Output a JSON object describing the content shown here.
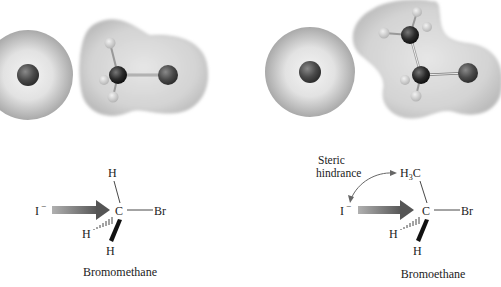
{
  "panels": [
    {
      "name": "bromomethane",
      "nucleophile": "I",
      "nucleophile_charge": "−",
      "center": "C",
      "leaving_group": "Br",
      "substituents": [
        "H",
        "H",
        "H"
      ],
      "caption": "Bromomethane"
    },
    {
      "name": "bromoethane",
      "nucleophile": "I",
      "nucleophile_charge": "−",
      "center": "C",
      "leaving_group": "Br",
      "top_group_main": "H",
      "top_group_sub": "3",
      "top_group_tail": "C",
      "substituents": [
        "H",
        "H"
      ],
      "annotation_line1": "Steric",
      "annotation_line2": "hindrance",
      "caption": "Bromoethane"
    }
  ],
  "colors": {
    "cloud": "#c8c8c8",
    "atom_dark": "#2a2a2a",
    "atom_halogen": "#4a4a4a",
    "atom_h": "#d8d8d8",
    "arrow": "#6e6e6e",
    "text": "#222222"
  }
}
